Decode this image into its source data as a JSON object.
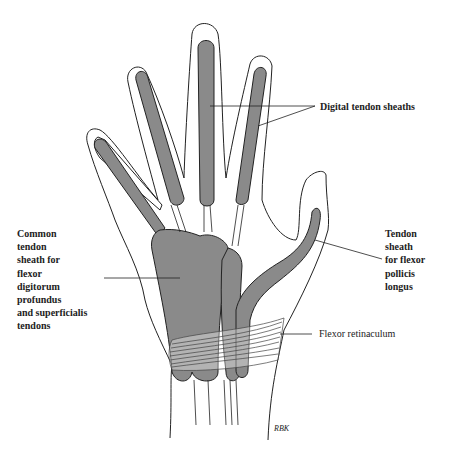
{
  "figure": {
    "colors": {
      "background": "#ffffff",
      "outline": "#222222",
      "sheath_fill": "#8a8a8a"
    },
    "labels": {
      "digital_sheaths": "Digital tendon sheaths",
      "common_sheath": "Common\ntendon\nsheath for\nflexor\ndigitorum\nprofundus\nand superficialis\ntendons",
      "fpl_sheath": "Tendon\nsheath\nfor flexor\npollicis\nlongus",
      "retinaculum": "Flexor retinaculum"
    },
    "signature": "RBK"
  }
}
